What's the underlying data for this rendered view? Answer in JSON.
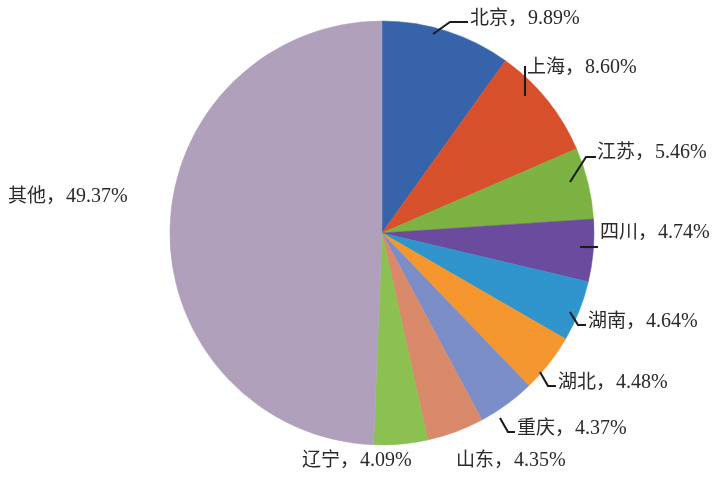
{
  "chart_data": {
    "type": "pie",
    "title": "",
    "subtitle": "",
    "xlabel": "",
    "ylabel": "",
    "legend_position": "none",
    "label_format": "name，value%",
    "start_angle_deg": 0,
    "direction": "clockwise",
    "unit": "%",
    "total": 100.0,
    "categories": [
      "北京",
      "上海",
      "江苏",
      "四川",
      "湖南",
      "湖北",
      "重庆",
      "山东",
      "辽宁",
      "其他"
    ],
    "values": [
      9.89,
      8.6,
      5.46,
      4.74,
      4.64,
      4.48,
      4.37,
      4.35,
      4.09,
      49.37
    ],
    "colors": [
      "#3763ab",
      "#d8502c",
      "#7cb342",
      "#6b4b9e",
      "#2f95cc",
      "#f5972e",
      "#7b8ec8",
      "#d98a6a",
      "#8cc152",
      "#b1a0bc"
    ],
    "slices": [
      {
        "name": "北京",
        "value": 9.89,
        "label": "北京，9.89%",
        "color": "#3763ab"
      },
      {
        "name": "上海",
        "value": 8.6,
        "label": "上海，8.60%",
        "color": "#d8502c"
      },
      {
        "name": "江苏",
        "value": 5.46,
        "label": "江苏，5.46%",
        "color": "#7cb342"
      },
      {
        "name": "四川",
        "value": 4.74,
        "label": "四川，4.74%",
        "color": "#6b4b9e"
      },
      {
        "name": "湖南",
        "value": 4.64,
        "label": "湖南，4.64%",
        "color": "#2f95cc"
      },
      {
        "name": "湖北",
        "value": 4.48,
        "label": "湖北，4.48%",
        "color": "#f5972e"
      },
      {
        "name": "重庆",
        "value": 4.37,
        "label": "重庆，4.37%",
        "color": "#7b8ec8"
      },
      {
        "name": "山东",
        "value": 4.35,
        "label": "山东，4.35%",
        "color": "#d98a6a"
      },
      {
        "name": "辽宁",
        "value": 4.09,
        "label": "辽宁，4.09%",
        "color": "#8cc152"
      },
      {
        "name": "其他",
        "value": 49.37,
        "label": "其他，49.37%",
        "color": "#b1a0bc"
      }
    ]
  },
  "labels": {
    "beijing": {
      "name": "北京",
      "sep": "，",
      "value": "9.89%"
    },
    "shanghai": {
      "name": "上海",
      "sep": "，",
      "value": "8.60%"
    },
    "jiangsu": {
      "name": "江苏",
      "sep": "，",
      "value": "5.46%"
    },
    "sichuan": {
      "name": "四川",
      "sep": "，",
      "value": "4.74%"
    },
    "hunan": {
      "name": "湖南",
      "sep": "，",
      "value": "4.64%"
    },
    "hubei": {
      "name": "湖北",
      "sep": "，",
      "value": "4.48%"
    },
    "chongqing": {
      "name": "重庆",
      "sep": "，",
      "value": "4.37%"
    },
    "shandong": {
      "name": "山东",
      "sep": "，",
      "value": "4.35%"
    },
    "liaoning": {
      "name": "辽宁",
      "sep": "，",
      "value": "4.09%"
    },
    "other": {
      "name": "其他",
      "sep": "，",
      "value": "49.37%"
    }
  }
}
